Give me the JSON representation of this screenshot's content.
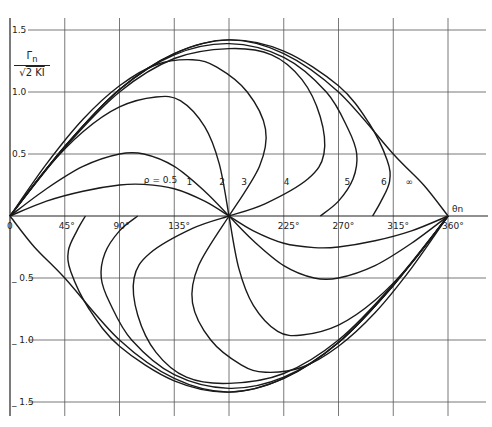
{
  "chart_data": {
    "type": "line",
    "title": "",
    "xlabel": "θn",
    "ylabel": "Γn / √(2KI)",
    "xlim": [
      0,
      360
    ],
    "ylim": [
      -1.5,
      1.5
    ],
    "grid": true,
    "x_ticks": [
      {
        "value": 0,
        "label": "0"
      },
      {
        "value": 45,
        "label": "45°"
      },
      {
        "value": 90,
        "label": "90°"
      },
      {
        "value": 135,
        "label": "135°"
      },
      {
        "value": 225,
        "label": "225°"
      },
      {
        "value": 270,
        "label": "270°"
      },
      {
        "value": 315,
        "label": "315°"
      },
      {
        "value": 360,
        "label": "360°"
      }
    ],
    "y_ticks": [
      {
        "value": 1.5,
        "label": "1.5"
      },
      {
        "value": 1.0,
        "label": "1.0"
      },
      {
        "value": 0.5,
        "label": "0.5"
      },
      {
        "value": -0.5,
        "label": "0.5"
      },
      {
        "value": -1.0,
        "label": "1.0"
      },
      {
        "value": -1.5,
        "label": "1.5"
      }
    ],
    "series": [
      {
        "name": "ρ = 0.5",
        "label": "ρ = 0.5",
        "label_pos": [
          110,
          0.27
        ],
        "x": [
          0,
          30,
          60,
          90,
          110,
          135,
          160,
          180
        ],
        "upper": [
          0,
          0.12,
          0.2,
          0.25,
          0.255,
          0.22,
          0.12,
          0
        ]
      },
      {
        "name": "1",
        "label": "1",
        "label_pos": [
          145,
          0.25
        ],
        "x": [
          0,
          30,
          60,
          90,
          110,
          135,
          160,
          180
        ],
        "upper": [
          0,
          0.22,
          0.4,
          0.5,
          0.5,
          0.4,
          0.2,
          0
        ]
      },
      {
        "name": "2",
        "label": "2",
        "label_pos": [
          172,
          0.25
        ],
        "x": [
          0,
          30,
          60,
          90,
          120,
          140,
          160,
          172,
          180
        ],
        "upper": [
          0,
          0.38,
          0.68,
          0.88,
          0.96,
          0.93,
          0.72,
          0.42,
          0
        ]
      },
      {
        "name": "3",
        "label": "3",
        "label_pos": [
          190,
          0.25
        ],
        "x": [
          0,
          30,
          60,
          90,
          120,
          150,
          170,
          195,
          210,
          205,
          180
        ],
        "upper": [
          0,
          0.42,
          0.78,
          1.05,
          1.22,
          1.26,
          1.2,
          1.0,
          0.7,
          0.4,
          0
        ]
      },
      {
        "name": "4",
        "label": "4",
        "label_pos": [
          225,
          0.25
        ],
        "x": [
          0,
          45,
          90,
          135,
          180,
          215,
          240,
          255,
          258,
          245,
          210,
          180
        ],
        "upper": [
          0,
          0.55,
          1.0,
          1.27,
          1.35,
          1.3,
          1.1,
          0.8,
          0.5,
          0.3,
          0.1,
          0
        ]
      },
      {
        "name": "5",
        "label": "5",
        "label_pos": [
          275,
          0.25
        ],
        "x": [
          0,
          45,
          90,
          135,
          180,
          225,
          260,
          278,
          285,
          282,
          270,
          255
        ],
        "upper": [
          0,
          0.56,
          1.02,
          1.3,
          1.39,
          1.28,
          1.0,
          0.7,
          0.5,
          0.3,
          0.12,
          0
        ]
      },
      {
        "name": "6",
        "label": "6",
        "label_pos": [
          305,
          0.25
        ],
        "x": [
          0,
          45,
          90,
          135,
          180,
          225,
          270,
          295,
          310,
          312,
          305,
          298
        ],
        "upper": [
          0,
          0.56,
          1.02,
          1.31,
          1.42,
          1.33,
          1.05,
          0.75,
          0.45,
          0.28,
          0.12,
          0
        ]
      },
      {
        "name": "∞",
        "label": "∞",
        "label_pos": [
          325,
          0.25
        ],
        "x": [
          0,
          45,
          90,
          135,
          180,
          225,
          270,
          315,
          340,
          360
        ],
        "upper": [
          0,
          0.56,
          1.02,
          1.31,
          1.42,
          1.31,
          1.0,
          0.5,
          0.25,
          0
        ]
      }
    ],
    "symmetry": "lower half is the upper half rotated 180° about (180°, 0)"
  }
}
